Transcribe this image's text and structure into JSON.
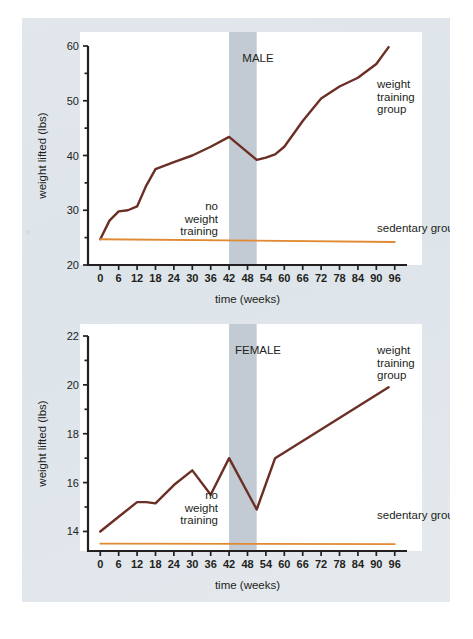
{
  "figure": {
    "background_color": "#dfe5ea",
    "plot_background_color": "#ffffff",
    "axis_color": "#231f20",
    "training_line_color": "#6b2f25",
    "sedentary_line_color": "#e08a33",
    "shade_color": "#c2cbd3"
  },
  "chart_data": [
    {
      "type": "line",
      "title": "MALE",
      "xlabel": "time (weeks)",
      "ylabel": "weight lifted (lbs)",
      "xlim": [
        -4,
        100
      ],
      "ylim": [
        20,
        60
      ],
      "xticks": [
        0,
        6,
        12,
        18,
        24,
        30,
        36,
        42,
        48,
        54,
        60,
        66,
        72,
        78,
        84,
        90,
        96
      ],
      "xtick_labels": [
        "0",
        "6",
        "12",
        "18",
        "24",
        "30",
        "36",
        "42",
        "48",
        "54",
        "60",
        "66",
        "72",
        "78",
        "84",
        "90",
        "96"
      ],
      "yticks": [
        20,
        25,
        30,
        35,
        40,
        45,
        50,
        55,
        60
      ],
      "ytick_labels": [
        "20",
        "",
        "30",
        "",
        "40",
        "",
        "50",
        "",
        "60"
      ],
      "grid": false,
      "legend_position": "inline-right",
      "annotations": [
        {
          "name": "no-weight-training",
          "text": "no weight training",
          "x": 40,
          "y": 27
        },
        {
          "name": "weight-training-group",
          "text": "weight training group",
          "x": 90,
          "y": 53
        },
        {
          "name": "sedentary-group",
          "text": "sedentary group",
          "x": 90,
          "y": 27
        }
      ],
      "shaded_region": {
        "label": "no weight training",
        "x_start": 42,
        "x_end": 51
      },
      "series": [
        {
          "name": "weight training group",
          "color": "#6b2f25",
          "x": [
            0,
            3,
            6,
            9,
            12,
            15,
            18,
            24,
            30,
            36,
            42,
            51,
            54,
            57,
            60,
            66,
            72,
            78,
            84,
            90,
            94
          ],
          "values": [
            24.7,
            28.1,
            29.8,
            30.0,
            30.7,
            34.5,
            37.5,
            38.8,
            40.0,
            41.6,
            43.4,
            39.2,
            39.6,
            40.2,
            41.6,
            46.3,
            50.4,
            52.6,
            54.2,
            56.7,
            59.8
          ]
        },
        {
          "name": "sedentary group",
          "color": "#e08a33",
          "x": [
            0,
            96
          ],
          "values": [
            24.7,
            24.2
          ]
        }
      ]
    },
    {
      "type": "line",
      "title": "FEMALE",
      "xlabel": "time (weeks)",
      "ylabel": "weight lifted (lbs)",
      "xlim": [
        -4,
        100
      ],
      "ylim": [
        13.2,
        22
      ],
      "xticks": [
        0,
        6,
        12,
        18,
        24,
        30,
        36,
        42,
        48,
        54,
        60,
        66,
        72,
        78,
        84,
        90,
        96
      ],
      "xtick_labels": [
        "0",
        "6",
        "12",
        "18",
        "24",
        "30",
        "36",
        "42",
        "48",
        "54",
        "60",
        "66",
        "72",
        "78",
        "84",
        "90",
        "96"
      ],
      "yticks": [
        14,
        15,
        16,
        17,
        18,
        19,
        20,
        21,
        22
      ],
      "ytick_labels": [
        "14",
        "",
        "16",
        "",
        "18",
        "",
        "20",
        "",
        "22"
      ],
      "grid": false,
      "legend_position": "inline-right",
      "annotations": [
        {
          "name": "no-weight-training",
          "text": "no weight training",
          "x": 40,
          "y": 14.6
        },
        {
          "name": "weight-training-group",
          "text": "weight training group",
          "x": 90,
          "y": 20.9
        },
        {
          "name": "sedentary-group",
          "text": "sedentary group",
          "x": 90,
          "y": 14.3
        }
      ],
      "shaded_region": {
        "label": "no weight training",
        "x_start": 42,
        "x_end": 51
      },
      "series": [
        {
          "name": "weight training group",
          "color": "#6b2f25",
          "x": [
            0,
            6,
            12,
            15,
            18,
            24,
            30,
            36,
            42,
            51,
            57,
            94
          ],
          "values": [
            14.0,
            14.6,
            15.2,
            15.2,
            15.15,
            15.9,
            16.5,
            15.5,
            17.0,
            14.9,
            17.0,
            19.9
          ]
        },
        {
          "name": "sedentary group",
          "color": "#e08a33",
          "x": [
            0,
            96
          ],
          "values": [
            13.5,
            13.48
          ]
        }
      ]
    }
  ]
}
